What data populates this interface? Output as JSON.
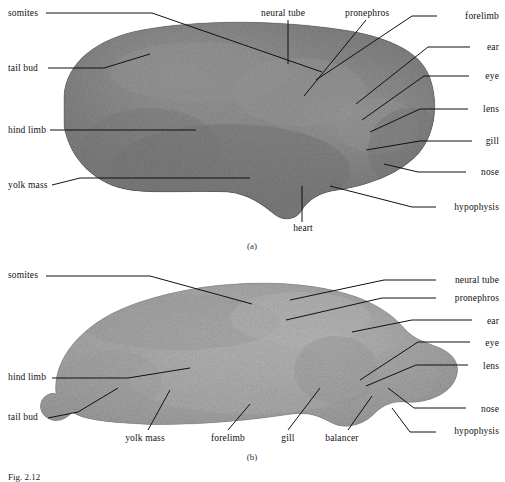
{
  "figure": {
    "type": "scientific-photographic-plate",
    "panel_a": {
      "caption": "(a)",
      "labels_left": [
        {
          "text": "somites",
          "x": 8,
          "y": 9
        },
        {
          "text": "tail bud",
          "x": 8,
          "y": 64
        },
        {
          "text": "hind limb",
          "x": 8,
          "y": 126
        },
        {
          "text": "yolk mass",
          "x": 8,
          "y": 181
        }
      ],
      "labels_right": [
        {
          "text": "forelimb",
          "x": 441,
          "y": 12
        },
        {
          "text": "ear",
          "x": 477,
          "y": 43
        },
        {
          "text": "eye",
          "x": 476,
          "y": 72
        },
        {
          "text": "lens",
          "x": 474,
          "y": 105
        },
        {
          "text": "gill",
          "x": 479,
          "y": 137
        },
        {
          "text": "nose",
          "x": 472,
          "y": 168
        },
        {
          "text": "hypophysis",
          "x": 441,
          "y": 203
        }
      ],
      "labels_top": [
        {
          "text": "neural tube",
          "x": 263,
          "y": 9
        },
        {
          "text": "pronephros",
          "x": 347,
          "y": 9
        }
      ],
      "labels_bottom": [
        {
          "text": "heart",
          "x": 289,
          "y": 224
        }
      ]
    },
    "panel_b": {
      "caption": "(b)",
      "labels_left": [
        {
          "text": "somites",
          "x": 8,
          "y": 271
        },
        {
          "text": "hind limb",
          "x": 8,
          "y": 373
        },
        {
          "text": "tail bud",
          "x": 8,
          "y": 413
        }
      ],
      "labels_right": [
        {
          "text": "neural tube",
          "x": 440,
          "y": 276
        },
        {
          "text": "pronephros",
          "x": 440,
          "y": 294
        },
        {
          "text": "ear",
          "x": 479,
          "y": 317
        },
        {
          "text": "eye",
          "x": 477,
          "y": 339
        },
        {
          "text": "lens",
          "x": 474,
          "y": 362
        },
        {
          "text": "nose",
          "x": 472,
          "y": 405
        },
        {
          "text": "hypophysis",
          "x": 440,
          "y": 427
        }
      ],
      "labels_bottom": [
        {
          "text": "yolk mass",
          "x": 119,
          "y": 434
        },
        {
          "text": "forelimb",
          "x": 205,
          "y": 434
        },
        {
          "text": "gill",
          "x": 279,
          "y": 434
        },
        {
          "text": "balancer",
          "x": 321,
          "y": 434
        }
      ]
    },
    "figure_caption": "Fig. 2.12",
    "colors": {
      "ink": "#111111",
      "background": "#ffffff",
      "specimen_dark": "#3a3a3a",
      "specimen_mid": "#7d7d7d",
      "specimen_light": "#c8c8c8"
    }
  }
}
